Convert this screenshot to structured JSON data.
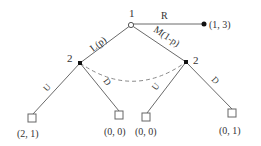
{
  "diagram": {
    "type": "extensive-form game tree",
    "root": {
      "player_label": "1"
    },
    "actions": {
      "left": "L(p)",
      "middle": "M(1-p)",
      "right": "R"
    },
    "right_payoff": "(1, 3)",
    "player2_left_label": "2",
    "player2_right_label": "2",
    "player2_actions": {
      "left_U": "U",
      "left_D": "D",
      "right_U": "U",
      "right_D": "D"
    },
    "payoffs": [
      "(2, 1)",
      "(0, 0)",
      "(0, 0)",
      "(0, 1)"
    ],
    "colors": {
      "line": "#6a6a6a",
      "node": "#111111",
      "dashed": "#8a8a8a"
    }
  }
}
